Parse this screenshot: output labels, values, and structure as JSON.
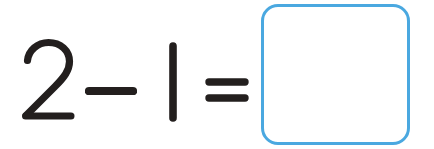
{
  "worksheet": {
    "title": "Subtraction problem worksheet",
    "background_color": "#ffffff",
    "ink_color": "#231f1e",
    "accent_color": "#4aa8e0"
  },
  "problem": {
    "expression": "2 - 1 =",
    "operand_one": "2",
    "operator_subtract": "−",
    "operand_two": "1",
    "operator_equals": "=",
    "answer_value": "",
    "answer_placeholder": ""
  },
  "icons": {
    "digit_two": "digit-two-glyph",
    "minus": "minus-sign-glyph",
    "digit_one": "digit-one-glyph",
    "equals": "equals-sign-glyph"
  }
}
